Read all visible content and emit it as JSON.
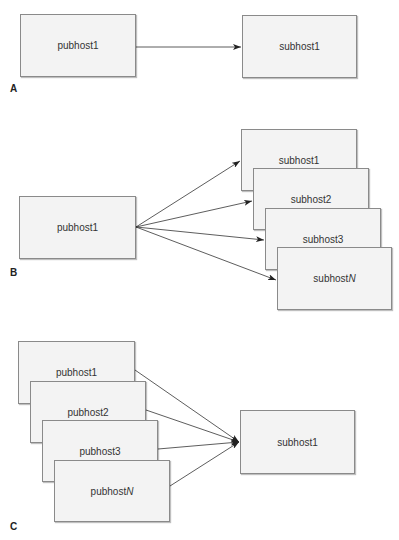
{
  "panels": [
    {
      "label": "A",
      "nodes": [
        {
          "id": "pubhost1",
          "text": "pubhost1",
          "x": 20,
          "y": 14,
          "w": 116,
          "h": 63
        },
        {
          "id": "subhost1",
          "text": "subhost1",
          "x": 242,
          "y": 15,
          "w": 115,
          "h": 63
        }
      ]
    },
    {
      "label": "B",
      "nodes": [
        {
          "id": "pubhost1",
          "text": "pubhost1",
          "x": 19,
          "y": 196,
          "w": 117,
          "h": 63
        },
        {
          "id": "subhost1",
          "text": "subhost1",
          "x": 241,
          "y": 129,
          "w": 116,
          "h": 62
        },
        {
          "id": "subhost2",
          "text": "subhost2",
          "x": 253,
          "y": 168,
          "w": 116,
          "h": 62
        },
        {
          "id": "subhost3",
          "text": "subhost3",
          "x": 265,
          "y": 208,
          "w": 116,
          "h": 62
        },
        {
          "id": "subhostN",
          "text": "subhost",
          "italic_suffix": "N",
          "x": 277,
          "y": 247,
          "w": 115,
          "h": 63
        }
      ]
    },
    {
      "label": "C",
      "nodes": [
        {
          "id": "pubhost1",
          "text": "pubhost1",
          "x": 18,
          "y": 341,
          "w": 117,
          "h": 63
        },
        {
          "id": "pubhost2",
          "text": "pubhost2",
          "x": 30,
          "y": 381,
          "w": 116,
          "h": 62
        },
        {
          "id": "pubhost3",
          "text": "pubhost3",
          "x": 42,
          "y": 420,
          "w": 116,
          "h": 62
        },
        {
          "id": "pubhostN",
          "text": "pubhost",
          "italic_suffix": "N",
          "x": 54,
          "y": 460,
          "w": 116,
          "h": 62
        },
        {
          "id": "subhost1",
          "text": "subhost1",
          "x": 240,
          "y": 410,
          "w": 115,
          "h": 64
        }
      ]
    }
  ],
  "labels": {
    "a": "A",
    "b": "B",
    "c": "C"
  },
  "text": {
    "a_pub1": "pubhost1",
    "a_sub1": "subhost1",
    "b_pub1": "pubhost1",
    "b_sub1": "subhost1",
    "b_sub2": "subhost2",
    "b_sub3": "subhost3",
    "b_subN_prefix": "subhost",
    "b_subN_suffix": "N",
    "c_pub1": "pubhost1",
    "c_pub2": "pubhost2",
    "c_pub3": "pubhost3",
    "c_pubN_prefix": "pubhost",
    "c_pubN_suffix": "N",
    "c_sub1": "subhost1"
  },
  "edges": {
    "A": [
      {
        "from": "pubhost1",
        "to": "subhost1"
      }
    ],
    "B": [
      {
        "from": "pubhost1",
        "to": "subhost1"
      },
      {
        "from": "pubhost1",
        "to": "subhost2"
      },
      {
        "from": "pubhost1",
        "to": "subhost3"
      },
      {
        "from": "pubhost1",
        "to": "subhostN"
      }
    ],
    "C": [
      {
        "from": "pubhost1",
        "to": "subhost1"
      },
      {
        "from": "pubhost2",
        "to": "subhost1"
      },
      {
        "from": "pubhost3",
        "to": "subhost1"
      },
      {
        "from": "pubhostN",
        "to": "subhost1"
      }
    ]
  },
  "colors": {
    "box_fill": "#f3f3f3",
    "box_border": "#8a8a8a",
    "text": "#333333",
    "arrow": "#222222"
  }
}
